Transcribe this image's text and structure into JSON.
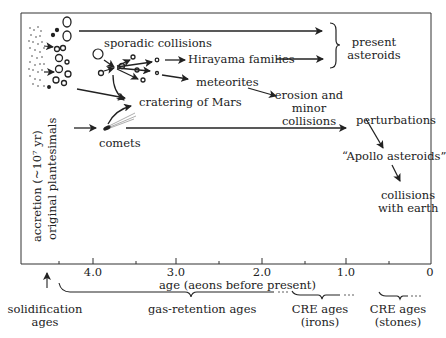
{
  "diagram": {
    "nodes": {
      "accretion": "accretion (~10⁷ yr)",
      "original_planetesimals": "original plantesimals",
      "sporadic_collisions": "sporadic collisions",
      "hirayama_families": "Hirayama families",
      "meteorites": "meteorites",
      "cratering_of_mars": "cratering of Mars",
      "comets": "comets",
      "present_asteroids_1": "present",
      "present_asteroids_2": "asteroids",
      "erosion_1": "erosion and",
      "erosion_2": "minor",
      "erosion_3": "collisions",
      "perturbations": "perturbations",
      "apollo_asteroids": "“Apollo asteroids”",
      "collisions_earth_1": "collisions",
      "collisions_earth_2": "with earth"
    },
    "axis": {
      "label": "age (aeons before present)",
      "ticks": [
        "4.0",
        "3.0",
        "2.0",
        "1.0",
        "0"
      ]
    },
    "age_ranges": {
      "solidification_1": "solidification",
      "solidification_2": "ages",
      "gas_retention": "gas-retention ages",
      "cre_irons_1": "CRE ages",
      "cre_irons_2": "(irons)",
      "cre_stones_1": "CRE ages",
      "cre_stones_2": "(stones)"
    }
  }
}
